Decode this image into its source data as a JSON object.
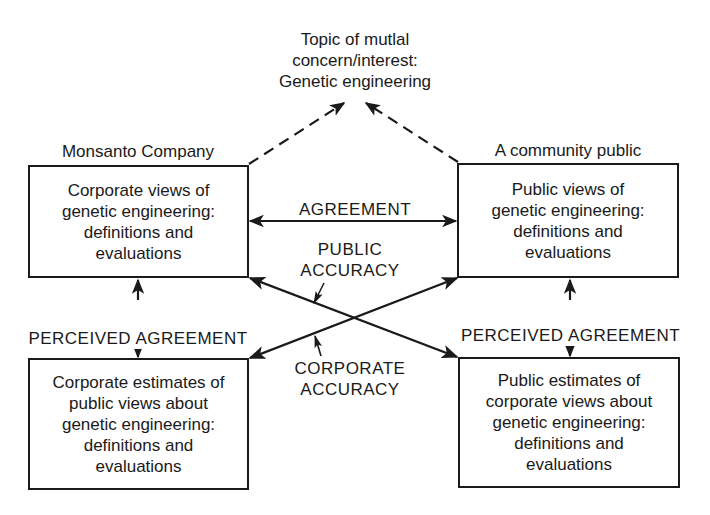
{
  "topic": {
    "text": "Topic of mutlal\nconcern/interest:\nGenetic engineering"
  },
  "parties": {
    "left_label": "Monsanto Company",
    "right_label": "A community public"
  },
  "boxes": {
    "corporate_views": "Corporate views of\ngenetic engineering:\ndefinitions and\nevaluations",
    "public_views": "Public views of\ngenetic engineering:\ndefinitions and\nevaluations",
    "corporate_estimates": "Corporate estimates of\npublic views about\ngenetic engineering:\ndefinitions and\nevaluations",
    "public_estimates": "Public estimates of\ncorporate views about\ngenetic engineering:\ndefinitions and\nevaluations"
  },
  "relations": {
    "agreement": "AGREEMENT",
    "public_accuracy": "PUBLIC\nACCURACY",
    "corporate_accuracy": "CORPORATE\nACCURACY",
    "perceived_agreement_left": "PERCEIVED AGREEMENT",
    "perceived_agreement_right": "PERCEIVED AGREEMENT"
  },
  "colors": {
    "ink": "#1a1a1a",
    "background": "#ffffff"
  }
}
